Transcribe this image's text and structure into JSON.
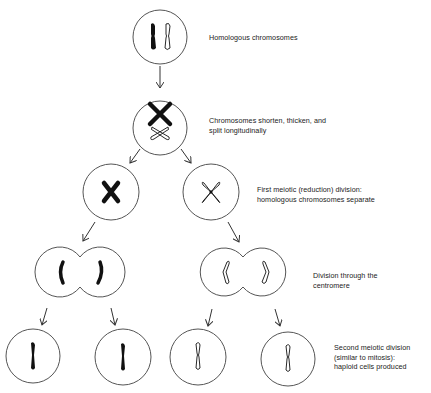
{
  "diagram": {
    "colors": {
      "line": "#555555",
      "chromosome_dark": "#111111",
      "text": "#222222",
      "background": "#ffffff"
    },
    "stages": [
      {
        "id": "homologous",
        "lines": [
          "Homologous chromosomes"
        ]
      },
      {
        "id": "shorten",
        "lines": [
          "Chromosomes shorten, thicken, and",
          "split longitudinally"
        ]
      },
      {
        "id": "first-division",
        "lines": [
          "First meiotic (reduction) division:",
          "homologous chromosomes separate"
        ]
      },
      {
        "id": "centromere-division",
        "lines": [
          "Division through the",
          "centromere"
        ]
      },
      {
        "id": "second-division",
        "lines": [
          "Second meiotic division",
          "(similar to mitosis):",
          "haploid cells produced"
        ]
      }
    ]
  }
}
